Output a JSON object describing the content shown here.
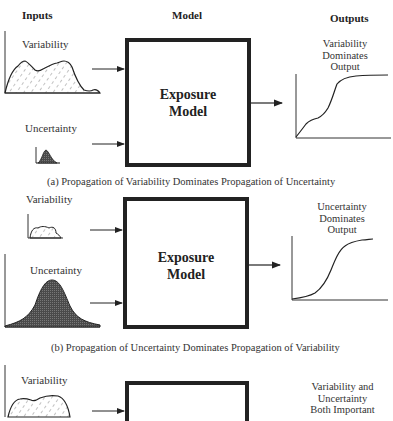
{
  "headers": {
    "inputs": "Inputs",
    "model": "Model",
    "outputs": "Outputs"
  },
  "panels": [
    {
      "id": "a",
      "inputs": {
        "variability_label": "Variability",
        "uncertainty_label": "Uncertainty"
      },
      "model_label_line1": "Exposure",
      "model_label_line2": "Model",
      "output_label_lines": [
        "Variability",
        "Dominates",
        "Output"
      ],
      "caption": "(a) Propagation of Variability Dominates Propagation of Uncertainty"
    },
    {
      "id": "b",
      "inputs": {
        "variability_label": "Variability",
        "uncertainty_label": "Uncertainty"
      },
      "model_label_line1": "Exposure",
      "model_label_line2": "Model",
      "output_label_lines": [
        "Uncertainty",
        "Dominates",
        "Output"
      ],
      "caption": "(b) Propagation of Uncertainty Dominates Propagation of Variability"
    },
    {
      "id": "c",
      "inputs": {
        "variability_label": "Variability"
      },
      "output_label_lines": [
        "Variability and",
        "Uncertainty",
        "Both Important"
      ]
    }
  ],
  "colors": {
    "ink": "#222222",
    "fill_dark": "#555555",
    "background": "#ffffff"
  }
}
